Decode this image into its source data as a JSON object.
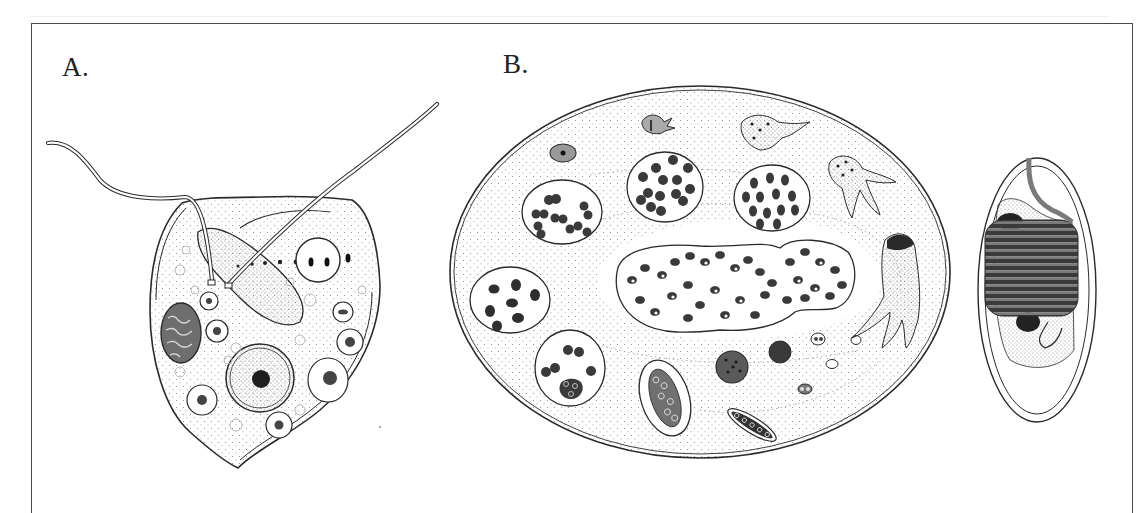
{
  "figure": {
    "panels": [
      {
        "id": "A",
        "label": "A.",
        "subject": "flagellate-cell"
      },
      {
        "id": "B",
        "label": "B.",
        "subject": "cyst-with-internal-stages"
      }
    ]
  },
  "colors": {
    "ink": "#2a2a2a",
    "frame": "#4a4a4a",
    "background": "#ffffff",
    "stipple": "#9a9a9a",
    "dark-fill": "#3a3a3a"
  }
}
